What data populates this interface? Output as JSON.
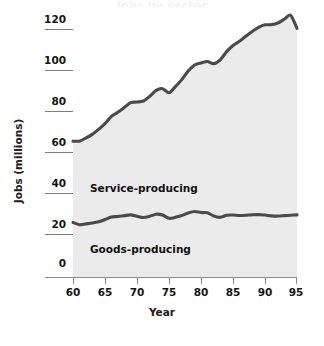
{
  "chart_data": {
    "type": "area",
    "title": "",
    "xlabel": "Year",
    "ylabel": "Jobs (millions)",
    "xlim": [
      60,
      95
    ],
    "ylim": [
      0,
      120
    ],
    "grid": false,
    "legend_position": "inline-labels",
    "xticks": [
      "60",
      "65",
      "70",
      "75",
      "80",
      "85",
      "90",
      "95"
    ],
    "yticks": [
      "0",
      "20",
      "40",
      "60",
      "80",
      "100",
      "120"
    ],
    "x": [
      60,
      61,
      62,
      63,
      64,
      65,
      66,
      67,
      68,
      69,
      70,
      71,
      72,
      73,
      74,
      75,
      76,
      77,
      78,
      79,
      80,
      81,
      82,
      83,
      84,
      85,
      86,
      87,
      88,
      89,
      90,
      91,
      92,
      93,
      94,
      95
    ],
    "stacked": true,
    "series": [
      {
        "name": "Goods-producing",
        "values": [
          26.5,
          25.4,
          25.8,
          26.2,
          26.8,
          27.9,
          29.1,
          29.4,
          29.8,
          30.2,
          29.5,
          28.9,
          29.5,
          30.5,
          30.1,
          28.5,
          29.0,
          29.9,
          31.1,
          31.8,
          31.3,
          31.2,
          29.6,
          29.0,
          30.0,
          30.1,
          29.9,
          30.0,
          30.2,
          30.3,
          30.1,
          29.7,
          29.6,
          29.8,
          30.0,
          30.2
        ]
      },
      {
        "name": "Service-producing",
        "values": [
          39.5,
          40.6,
          41.7,
          43.1,
          44.9,
          46.6,
          48.9,
          50.6,
          52.5,
          54.5,
          55.5,
          56.6,
          58.3,
          60.2,
          61.4,
          61.0,
          63.5,
          66.0,
          69.0,
          71.2,
          72.7,
          73.5,
          74.0,
          76.5,
          79.5,
          82.4,
          84.6,
          87.0,
          89.1,
          91.0,
          92.4,
          92.9,
          93.8,
          95.4,
          97.2,
          90.6
        ]
      }
    ],
    "totals_top_line": [
      66,
      66,
      67.5,
      69.3,
      71.7,
      74.5,
      78,
      80,
      82.3,
      84.7,
      85,
      85.5,
      87.8,
      90.7,
      91.5,
      89.5,
      92.5,
      95.9,
      100.1,
      103,
      104,
      104.7,
      103.6,
      105.5,
      109.5,
      112.5,
      114.5,
      117,
      119.3,
      121.3,
      122.5,
      122.6,
      123.4,
      125.2,
      127.2,
      120.8
    ],
    "annotations": [
      {
        "text": "Service-producing",
        "x": 67.5,
        "y": 42
      },
      {
        "text": "Goods-producing",
        "x": 67.5,
        "y": 13
      }
    ],
    "colors": {
      "fill": "#ebebeb",
      "line": "#4a4a4a",
      "axis": "#8a8a8a",
      "text": "#141414"
    }
  },
  "axis": {
    "y_title": "Jobs (millions)",
    "x_title": "Year",
    "y_ticks": [
      {
        "label": "120"
      },
      {
        "label": "100"
      },
      {
        "label": "80"
      },
      {
        "label": "60"
      },
      {
        "label": "40"
      },
      {
        "label": "20"
      },
      {
        "label": "0"
      }
    ],
    "x_ticks": [
      {
        "label": "60"
      },
      {
        "label": "65"
      },
      {
        "label": "70"
      },
      {
        "label": "75"
      },
      {
        "label": "80"
      },
      {
        "label": "85"
      },
      {
        "label": "90"
      },
      {
        "label": "95"
      }
    ]
  },
  "bands": {
    "service": "Service-producing",
    "goods": "Goods-producing"
  },
  "header": {
    "cut_off_title": "Jobs by sector"
  }
}
